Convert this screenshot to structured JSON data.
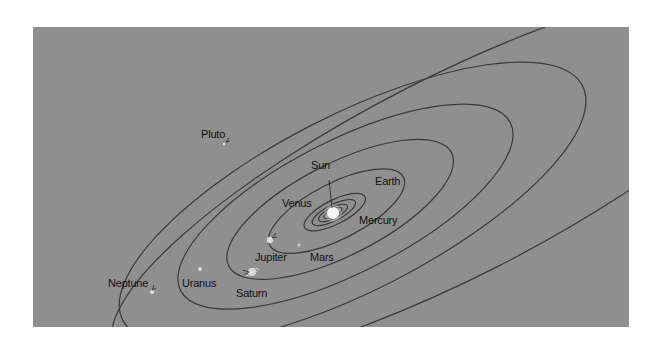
{
  "diagram": {
    "background": "#8f8f8f",
    "orbit_color": "#3a3a3a",
    "bodies": [
      {
        "name": "Sun",
        "label": "Sun"
      },
      {
        "name": "Mercury",
        "label": "Mercury"
      },
      {
        "name": "Venus",
        "label": "Venus"
      },
      {
        "name": "Earth",
        "label": "Earth"
      },
      {
        "name": "Mars",
        "label": "Mars"
      },
      {
        "name": "Jupiter",
        "label": "Jupiter"
      },
      {
        "name": "Saturn",
        "label": "Saturn"
      },
      {
        "name": "Uranus",
        "label": "Uranus"
      },
      {
        "name": "Neptune",
        "label": "Neptune"
      },
      {
        "name": "Pluto",
        "label": "Pluto"
      }
    ]
  }
}
